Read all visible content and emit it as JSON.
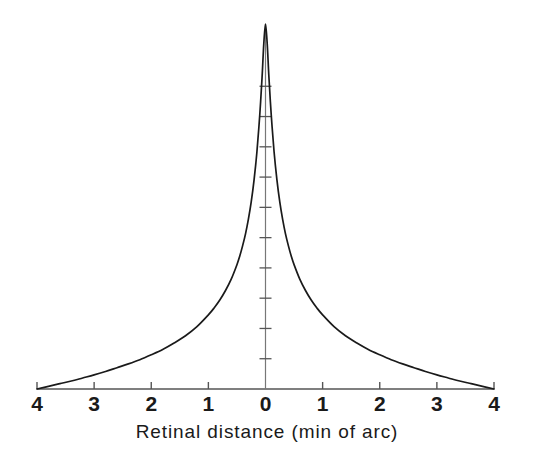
{
  "chart_data": {
    "type": "line",
    "title": "",
    "subtitle": "",
    "xlabel": "Retinal distance (min of arc)",
    "ylabel": "",
    "xlim": [
      -4,
      4
    ],
    "ylim": [
      0,
      1
    ],
    "grid": false,
    "legend": null,
    "x_tick_labels": [
      "4",
      "3",
      "2",
      "1",
      "0",
      "1",
      "2",
      "3",
      "4"
    ],
    "x_tick_values": [
      -4,
      -3,
      -2,
      -1,
      0,
      1,
      2,
      3,
      4
    ],
    "y_tick_labels": [],
    "y_tick_count": 10,
    "series": [
      {
        "name": "line spread function",
        "x": [
          -4.0,
          -3.8,
          -3.6,
          -3.4,
          -3.2,
          -3.0,
          -2.8,
          -2.6,
          -2.4,
          -2.2,
          -2.0,
          -1.8,
          -1.6,
          -1.4,
          -1.2,
          -1.0,
          -0.9,
          -0.8,
          -0.7,
          -0.6,
          -0.5,
          -0.45,
          -0.4,
          -0.35,
          -0.3,
          -0.25,
          -0.2,
          -0.15,
          -0.1,
          -0.06,
          -0.03,
          0.0,
          0.03,
          0.06,
          0.1,
          0.15,
          0.2,
          0.25,
          0.3,
          0.35,
          0.4,
          0.45,
          0.5,
          0.6,
          0.7,
          0.8,
          0.9,
          1.0,
          1.2,
          1.4,
          1.6,
          1.8,
          2.0,
          2.2,
          2.4,
          2.6,
          2.8,
          3.0,
          3.2,
          3.4,
          3.6,
          3.8,
          4.0
        ],
        "y": [
          0.0,
          0.007,
          0.014,
          0.021,
          0.029,
          0.037,
          0.046,
          0.056,
          0.066,
          0.077,
          0.09,
          0.104,
          0.121,
          0.14,
          0.164,
          0.195,
          0.213,
          0.234,
          0.259,
          0.289,
          0.327,
          0.35,
          0.377,
          0.408,
          0.446,
          0.492,
          0.55,
          0.624,
          0.722,
          0.82,
          0.908,
          0.96,
          0.908,
          0.82,
          0.722,
          0.624,
          0.55,
          0.492,
          0.446,
          0.408,
          0.377,
          0.35,
          0.327,
          0.289,
          0.259,
          0.234,
          0.213,
          0.195,
          0.164,
          0.14,
          0.121,
          0.104,
          0.09,
          0.077,
          0.066,
          0.056,
          0.046,
          0.037,
          0.029,
          0.021,
          0.014,
          0.007,
          0.0
        ]
      }
    ],
    "colors": {
      "line": "#1a1a1a",
      "axis": "#555555",
      "background": "#ffffff",
      "text": "#1a1a1a"
    },
    "annotations": []
  }
}
